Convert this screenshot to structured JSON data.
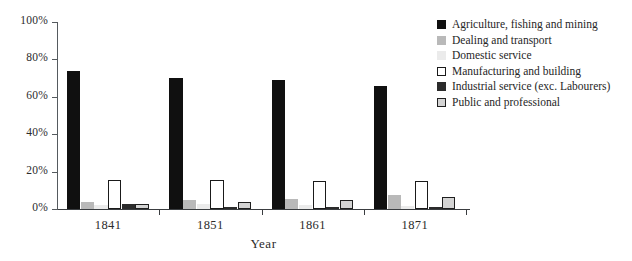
{
  "chart_data": {
    "type": "bar",
    "title": "",
    "xlabel": "Year",
    "ylabel": "",
    "categories": [
      "1841",
      "1851",
      "1861",
      "1871"
    ],
    "ylim": [
      0,
      100
    ],
    "yticks": [
      "0%",
      "20%",
      "40%",
      "60%",
      "80%",
      "100%"
    ],
    "ytick_values": [
      0,
      20,
      40,
      60,
      80,
      100
    ],
    "grid": false,
    "legend_position": "right",
    "series": [
      {
        "name": "Agriculture, fishing and mining",
        "color": "#101010",
        "border": "#101010",
        "values": [
          74,
          70,
          69,
          66
        ]
      },
      {
        "name": "Dealing and transport",
        "color": "#b9b9b9",
        "border": "#b9b9b9",
        "values": [
          3.5,
          5,
          5.5,
          7.5
        ]
      },
      {
        "name": "Domestic service",
        "color": "#ebebeb",
        "border": "#ebebeb",
        "values": [
          2,
          2.5,
          2,
          1.5
        ]
      },
      {
        "name": "Manufacturing and building",
        "color": "#ffffff",
        "border": "#1a1a1a",
        "values": [
          15.5,
          15.5,
          15,
          15
        ]
      },
      {
        "name": "Industrial service (exc. Labourers)",
        "color": "#2b2b2b",
        "border": "#2b2b2b",
        "values": [
          2.5,
          1,
          1,
          1
        ]
      },
      {
        "name": "Public and professional",
        "color": "#d4d4d4",
        "border": "#1f1f1f",
        "values": [
          2.5,
          3.5,
          5,
          6.5
        ]
      }
    ]
  }
}
